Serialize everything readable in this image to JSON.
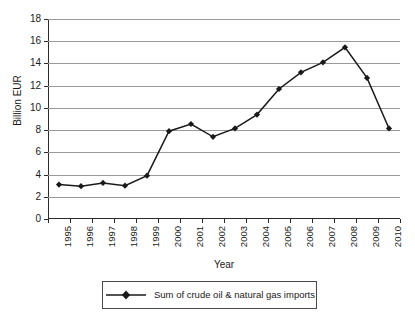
{
  "chart_data": {
    "type": "line",
    "title": "",
    "subtitle": "",
    "xlabel": "Year",
    "ylabel": "Billion EUR",
    "categories": [
      "1995",
      "1996",
      "1997",
      "1998",
      "1999",
      "2000",
      "2001",
      "2002",
      "2003",
      "2004",
      "2005",
      "2006",
      "2007",
      "2008",
      "2009",
      "2010"
    ],
    "series": [
      {
        "name": "Sum of crude oil & natural gas imports",
        "values": [
          3.1,
          2.95,
          3.25,
          3.0,
          3.9,
          7.9,
          8.55,
          7.4,
          8.15,
          9.4,
          11.7,
          13.2,
          14.1,
          15.45,
          12.7,
          8.15
        ]
      }
    ],
    "ylim": [
      0,
      18
    ],
    "yticks": [
      0,
      2,
      4,
      6,
      8,
      10,
      12,
      14,
      16,
      18
    ],
    "ytick_labels": [
      "0",
      "2",
      "4",
      "6",
      "8",
      "10",
      "12",
      "14",
      "16",
      "18"
    ],
    "grid": "horizontal",
    "legend_position": "bottom",
    "marker": "diamond",
    "line_color": "#1a1a1a",
    "grid_color": "#9a9a9a",
    "axis_color": "#2b2b2b",
    "background_color": "#ffffff"
  },
  "legend": {
    "entries": [
      {
        "label": "Sum of crude oil & natural gas imports"
      }
    ]
  }
}
